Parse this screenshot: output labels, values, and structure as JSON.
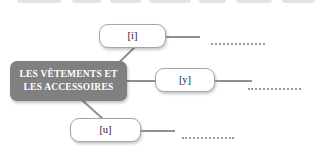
{
  "slide": {
    "background_color": "#ffffff",
    "accent_color": "#808080",
    "line_color": "#8f8f8f",
    "box_border_color": "#a6a6a6"
  },
  "top_strip": {
    "label": "cut-off row of shapes above",
    "chips": [
      {
        "left": 17,
        "width": 44
      },
      {
        "left": 72,
        "width": 29
      },
      {
        "left": 110,
        "width": 31
      },
      {
        "left": 149,
        "width": 42
      },
      {
        "left": 199,
        "width": 27
      },
      {
        "left": 236,
        "width": 36
      },
      {
        "left": 282,
        "width": 33
      }
    ]
  },
  "center_node": {
    "name": "central-topic",
    "lines": [
      "LES VÊTEMENTS ET",
      "LES ACCESSOIRES"
    ]
  },
  "branches": [
    {
      "id": "branch-i",
      "label": "[i]",
      "answer_line": "",
      "box": {
        "left": 99,
        "top": 24,
        "width": 67,
        "height": 24
      },
      "connector": {
        "left": 166,
        "top": 36,
        "width": 34
      },
      "dotline": {
        "left": 211,
        "top": 41,
        "width": 54
      }
    },
    {
      "id": "branch-y",
      "label": "[y]",
      "answer_line": "",
      "box": {
        "left": 155,
        "top": 68,
        "width": 60,
        "height": 24
      },
      "connector": {
        "left": 215,
        "top": 80,
        "width": 37
      },
      "dotline": {
        "left": 248,
        "top": 86,
        "width": 53
      }
    },
    {
      "id": "branch-u",
      "label": "[u]",
      "answer_line": "",
      "box": {
        "left": 70,
        "top": 118,
        "width": 71,
        "height": 24
      },
      "connector": {
        "left": 141,
        "top": 130,
        "width": 34
      },
      "dotline": {
        "left": 182,
        "top": 135,
        "width": 52
      }
    }
  ]
}
